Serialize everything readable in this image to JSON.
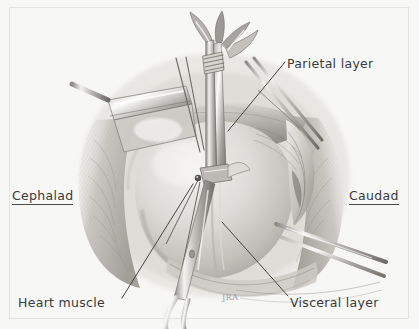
{
  "figure": {
    "kind": "surgical-illustration",
    "background_color": "#f7f7f6",
    "ink_color": "#3a3a3a",
    "border_color": "#e3e3e1"
  },
  "labels": {
    "cephalad": "Cephalad",
    "caudad": "Caudad",
    "parietal_layer": "Parietal layer",
    "visceral_layer": "Visceral layer",
    "heart_muscle": "Heart muscle"
  },
  "signature": "JRA"
}
